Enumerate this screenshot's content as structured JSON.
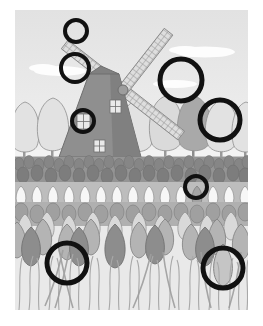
{
  "image": {
    "title": "Windmill in a tulip field",
    "style": "grayscale line illustration with black annotation circles",
    "canvas": {
      "width": 263,
      "height": 326,
      "background": "#ffffff"
    },
    "artwork_frame": {
      "x": 15,
      "y": 10,
      "width": 233,
      "height": 300
    }
  },
  "palette": {
    "paper_white": "#ffffff",
    "sky_top": "#e4e4e4",
    "sky_bottom": "#efefef",
    "cloud": "#fdfdfd",
    "ground_light": "#f2f2f2",
    "tree_light": "#e0e0e0",
    "tree_mid": "#cfcfcf",
    "tree_dark": "#a8a8a8",
    "trunk": "#9a9a9a",
    "mill_body": "#8f8f8f",
    "mill_body_shade": "#7d7d7d",
    "mill_window": "#e8e8e8",
    "blade_fill": "#dedede",
    "blade_line": "#8c8c8c",
    "tulip_dark": "#8b8b8b",
    "tulip_mid": "#b3b3b3",
    "tulip_light": "#dcdcdc",
    "tulip_white": "#f6f6f6",
    "stem": "#b9b9b9",
    "outline": "#6e6e6e",
    "annotation_circle": "#111111"
  },
  "scene": {
    "sky": {
      "label": "sky",
      "clouds": [
        {
          "name": "cloud-left",
          "cx": 45,
          "cy": 60,
          "rx": 30,
          "ry": 6
        },
        {
          "name": "cloud-right",
          "cx": 186,
          "cy": 42,
          "rx": 32,
          "ry": 6
        },
        {
          "name": "cloud-mid",
          "cx": 150,
          "cy": 78,
          "rx": 22,
          "ry": 4
        }
      ]
    },
    "windmill": {
      "label": "windmill",
      "body": {
        "apex_x": 86,
        "apex_y": 66,
        "base_left": 46,
        "base_right": 126,
        "base_y": 146
      },
      "hub": {
        "cx": 108,
        "cy": 80,
        "r": 5
      },
      "blade_count": 4,
      "blade_length": 72,
      "blade_width": 11,
      "windows": [
        {
          "name": "window-upper",
          "x": 95,
          "y": 92,
          "w": 10,
          "h": 12
        },
        {
          "name": "window-circled",
          "x": 77,
          "y": 114,
          "w": 12,
          "h": 14
        },
        {
          "name": "window-lower",
          "x": 75,
          "y": 138,
          "w": 10,
          "h": 10
        }
      ]
    },
    "treeline": {
      "label": "row of trees behind the field",
      "horizon_y": 146,
      "trees": [
        {
          "name": "tree-1",
          "cx": 10,
          "cy": 122,
          "rx": 16,
          "ry": 26,
          "tone": "tree_light"
        },
        {
          "name": "tree-2",
          "cx": 38,
          "cy": 118,
          "rx": 17,
          "ry": 28,
          "tone": "tree_light"
        },
        {
          "name": "tree-3",
          "cx": 122,
          "cy": 120,
          "rx": 18,
          "ry": 27,
          "tone": "tree_light"
        },
        {
          "name": "tree-4",
          "cx": 150,
          "cy": 116,
          "rx": 17,
          "ry": 29,
          "tone": "tree_mid"
        },
        {
          "name": "tree-5-dark",
          "cx": 178,
          "cy": 118,
          "rx": 18,
          "ry": 28,
          "tone": "tree_dark"
        },
        {
          "name": "tree-6",
          "cx": 206,
          "cy": 120,
          "rx": 17,
          "ry": 27,
          "tone": "tree_light"
        },
        {
          "name": "tree-7",
          "cx": 228,
          "cy": 122,
          "rx": 15,
          "ry": 26,
          "tone": "tree_light"
        }
      ]
    },
    "tulip_field": {
      "label": "tulip field",
      "bands": [
        {
          "name": "band-far-dark",
          "y": 146,
          "height": 32,
          "tone": "tulip_dark",
          "bulb_w": 10,
          "bulb_h": 13
        },
        {
          "name": "band-white",
          "y": 176,
          "height": 22,
          "tone": "tulip_white",
          "bulb_w": 13,
          "bulb_h": 18
        },
        {
          "name": "band-mid",
          "y": 194,
          "height": 22,
          "tone": "tulip_mid",
          "bulb_w": 15,
          "bulb_h": 20
        },
        {
          "name": "band-fore-light",
          "y": 208,
          "height": 30,
          "tone": "tulip_light",
          "bulb_w": 20,
          "bulb_h": 28
        },
        {
          "name": "band-fore-dark",
          "y": 228,
          "height": 40,
          "tone": "tulip_dark",
          "bulb_w": 24,
          "bulb_h": 34
        }
      ],
      "stem_zone": {
        "y": 252,
        "height": 48
      }
    }
  },
  "annotations": {
    "label": "black circle markers highlighting picture details",
    "count": 9,
    "stroke_color": "#111111",
    "circles": [
      {
        "id": 1,
        "name": "circle-blade-tip-top",
        "cx": 61,
        "cy": 21,
        "r": 11,
        "stroke": 4,
        "target": "windmill blade tip"
      },
      {
        "id": 2,
        "name": "circle-blade-upper-left",
        "cx": 60,
        "cy": 58,
        "r": 14,
        "stroke": 4,
        "target": "upper left blade over sky"
      },
      {
        "id": 3,
        "name": "circle-mill-window",
        "cx": 68,
        "cy": 111,
        "r": 11,
        "stroke": 4,
        "target": "windmill window"
      },
      {
        "id": 4,
        "name": "circle-sky-right-large",
        "cx": 166,
        "cy": 70,
        "r": 21,
        "stroke": 5,
        "target": "sky above dark tree"
      },
      {
        "id": 5,
        "name": "circle-tree-right-large",
        "cx": 205,
        "cy": 110,
        "r": 20,
        "stroke": 5,
        "target": "tree at right of treeline"
      },
      {
        "id": 6,
        "name": "circle-white-tulip-row",
        "cx": 181,
        "cy": 177,
        "r": 11,
        "stroke": 4,
        "target": "tulip in white row"
      },
      {
        "id": 7,
        "name": "circle-foreground-left",
        "cx": 52,
        "cy": 253,
        "r": 20,
        "stroke": 5,
        "target": "foreground leaves lower left"
      },
      {
        "id": 8,
        "name": "circle-foreground-right",
        "cx": 208,
        "cy": 258,
        "r": 20,
        "stroke": 5,
        "target": "foreground tulip lower right"
      },
      {
        "id": 9,
        "name": "circle-blade-lattice",
        "cx": 61,
        "cy": 21,
        "r": 11,
        "stroke": 4,
        "target": "lattice detail duplicate marker"
      }
    ]
  }
}
